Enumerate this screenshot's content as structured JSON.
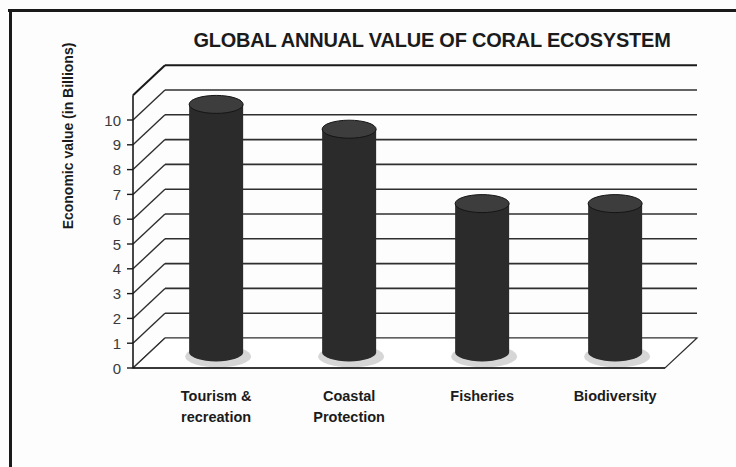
{
  "chart_data": {
    "type": "bar",
    "title": "GLOBAL ANNUAL VALUE OF CORAL ECOSYSTEM",
    "xlabel": "",
    "ylabel": "Economic value  (in Billions)",
    "categories": [
      "Tourism & recreation",
      "Coastal Protection",
      "Fisheries",
      "Biodiversity"
    ],
    "values": [
      10,
      9,
      6,
      6
    ],
    "ylim": [
      0,
      10
    ],
    "ytick_labels": [
      "10",
      "9",
      "8",
      "7",
      "6",
      "5",
      "4",
      "3",
      "2",
      "1",
      "0"
    ],
    "ytick_values": [
      10,
      9,
      8,
      7,
      6,
      5,
      4,
      3,
      2,
      1,
      0
    ],
    "grid": true,
    "legend": false,
    "style": "3d-cylinder",
    "bar_color": "#2b2b2b",
    "bar_top_color": "#3d3d3d",
    "axis_color": "#1a1a1a",
    "grid_color": "#2f2f2f",
    "background": "#ffffff"
  },
  "categories_display": [
    {
      "line1": "Tourism &",
      "line2": "recreation"
    },
    {
      "line1": "Coastal",
      "line2": "Protection"
    },
    {
      "line1": "Fisheries",
      "line2": ""
    },
    {
      "line1": "Biodiversity",
      "line2": ""
    }
  ]
}
